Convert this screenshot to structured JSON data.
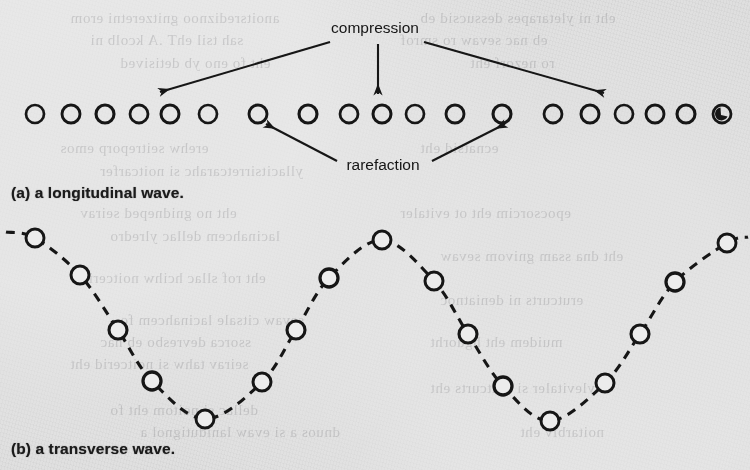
{
  "figure": {
    "background_color": "#ececec",
    "ink_color": "#171717",
    "panels": [
      {
        "id": "panel-a",
        "caption": "(a) a longitudinal wave.",
        "annotations": [
          {
            "id": "compression",
            "label": "compression",
            "x": 375,
            "y": 33
          },
          {
            "id": "rarefaction",
            "label": "rarefaction",
            "x": 383,
            "y": 170
          }
        ],
        "arrows": [
          {
            "id": "compression-arrow-left",
            "from": [
              330,
              42
            ],
            "to": [
              160,
              92
            ]
          },
          {
            "id": "compression-arrow-down",
            "from": [
              378,
              44
            ],
            "to": [
              378,
              94
            ]
          },
          {
            "id": "compression-arrow-right",
            "from": [
              424,
              42
            ],
            "to": [
              604,
              93
            ]
          },
          {
            "id": "rarefaction-arrow-left",
            "from": [
              337,
              161
            ],
            "to": [
              266,
              124
            ]
          },
          {
            "id": "rarefaction-arrow-right",
            "from": [
              432,
              161
            ],
            "to": [
              505,
              124
            ]
          }
        ],
        "particles_y": 114,
        "particle_radius": 9,
        "particles_x": [
          35,
          71,
          105,
          139,
          170,
          208,
          258,
          308,
          349,
          382,
          415,
          455,
          502,
          553,
          590,
          624,
          655,
          686,
          722
        ],
        "marked_particle_index": 18
      },
      {
        "id": "panel-b",
        "caption": "(b) a transverse wave.",
        "dashed": true,
        "particle_radius": 9,
        "points": [
          [
            35,
            238
          ],
          [
            80,
            275
          ],
          [
            118,
            330
          ],
          [
            152,
            381
          ],
          [
            205,
            419
          ],
          [
            262,
            382
          ],
          [
            296,
            330
          ],
          [
            329,
            278
          ],
          [
            382,
            240
          ],
          [
            434,
            281
          ],
          [
            468,
            334
          ],
          [
            503,
            386
          ],
          [
            550,
            421
          ],
          [
            605,
            383
          ],
          [
            640,
            334
          ],
          [
            675,
            282
          ],
          [
            727,
            243
          ]
        ],
        "tail_left": [
          6,
          232
        ],
        "tail_right": [
          748,
          237
        ]
      }
    ]
  },
  "chart_data": {
    "type": "scatter",
    "xlabel": "",
    "ylabel": "",
    "series": [
      {
        "name": "longitudinal particles",
        "x": [
          35,
          71,
          105,
          139,
          170,
          208,
          258,
          308,
          349,
          382,
          415,
          455,
          502,
          553,
          590,
          624,
          655,
          686,
          722
        ],
        "y": [
          114,
          114,
          114,
          114,
          114,
          114,
          114,
          114,
          114,
          114,
          114,
          114,
          114,
          114,
          114,
          114,
          114,
          114,
          114
        ]
      },
      {
        "name": "transverse particles",
        "x": [
          35,
          80,
          118,
          152,
          205,
          262,
          296,
          329,
          382,
          434,
          468,
          503,
          550,
          605,
          640,
          675,
          727
        ],
        "y": [
          238,
          275,
          330,
          381,
          419,
          382,
          330,
          278,
          240,
          281,
          334,
          386,
          421,
          383,
          334,
          282,
          243
        ]
      }
    ],
    "annotations": [
      "compression",
      "rarefaction"
    ],
    "grid": false,
    "legend": "none"
  },
  "bleedthrough": [
    {
      "text": "anoitsrediznoo gnitzeretni erom",
      "x": 70,
      "y": 10
    },
    {
      "text": "eht ni yletarapes dessucsid eb",
      "x": 420,
      "y": 10
    },
    {
      "text": "sah tsil ehT .A kcolb ni",
      "x": 90,
      "y": 32
    },
    {
      "text": "eb nac sevaw ro smrof",
      "x": 400,
      "y": 32
    },
    {
      "text": "eht fo eno yb detisived",
      "x": 120,
      "y": 55
    },
    {
      "text": "ro nezorf eht",
      "x": 470,
      "y": 55
    },
    {
      "text": "erehw seitreporp emos",
      "x": 60,
      "y": 140
    },
    {
      "text": "ecnatsid eht",
      "x": 420,
      "y": 140
    },
    {
      "text": "yllacitsirretcarahc si noitcarfer",
      "x": 100,
      "y": 163
    },
    {
      "text": "eht no gnidneped seirav",
      "x": 80,
      "y": 205
    },
    {
      "text": "epocsorcim eht ot evitaler",
      "x": 400,
      "y": 205
    },
    {
      "text": "lacinahcem dellac ylredro",
      "x": 110,
      "y": 228
    },
    {
      "text": "eht dna ssam gnivom sevaw",
      "x": 440,
      "y": 248
    },
    {
      "text": "eht rof sllac hcihw noitcerid",
      "x": 80,
      "y": 270
    },
    {
      "text": "erutcurts ni deniatnoc",
      "x": 440,
      "y": 292
    },
    {
      "text": "sevaw citsale lacinahcem fo",
      "x": 120,
      "y": 312
    },
    {
      "text": "ssorca devresbo eb nac",
      "x": 100,
      "y": 334
    },
    {
      "text": "muidem eht hguorht",
      "x": 430,
      "y": 334
    },
    {
      "text": "seirav tahw si noitcerid eht",
      "x": 70,
      "y": 356
    },
    {
      "text": "ylevitaler si erutcurts eht",
      "x": 430,
      "y": 380
    },
    {
      "text": "dellac si noitom eht fo",
      "x": 110,
      "y": 402
    },
    {
      "text": "dnuos a si evaw lanidutignol a",
      "x": 140,
      "y": 424
    },
    {
      "text": "noitarbiv eht",
      "x": 520,
      "y": 424
    }
  ]
}
